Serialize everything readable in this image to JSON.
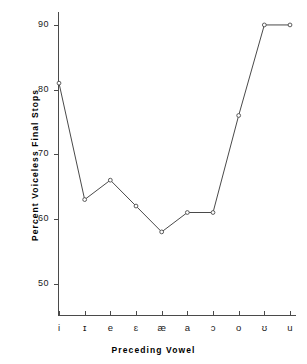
{
  "chart_data": {
    "type": "line",
    "title": "",
    "xlabel": "Preceding  Vowel",
    "ylabel": "Percent  Voiceless  Final  Stops",
    "categories": [
      "i",
      "ɪ",
      "e",
      "ɛ",
      "æ",
      "a",
      "ɔ",
      "o",
      "ʊ",
      "u"
    ],
    "values": [
      81,
      63,
      66,
      62,
      58,
      61,
      61,
      76,
      90,
      90
    ],
    "series": [
      {
        "name": "Percent Voiceless Final Stops",
        "values": [
          81,
          63,
          66,
          62,
          58,
          61,
          61,
          76,
          90,
          90
        ]
      }
    ],
    "ylim": [
      45,
      92
    ],
    "yticks": [
      50,
      60,
      70,
      80,
      90
    ],
    "ytick_labels": [
      "50",
      "60",
      "70",
      "80",
      "90"
    ],
    "xtick_labels": [
      "i",
      "ɪ",
      "e",
      "ɛ",
      "æ",
      "a",
      "ɔ",
      "o",
      "ʊ",
      "u"
    ],
    "grid": false,
    "legend": null,
    "marker": "open-circle",
    "line_color": "#4a4a4a"
  }
}
